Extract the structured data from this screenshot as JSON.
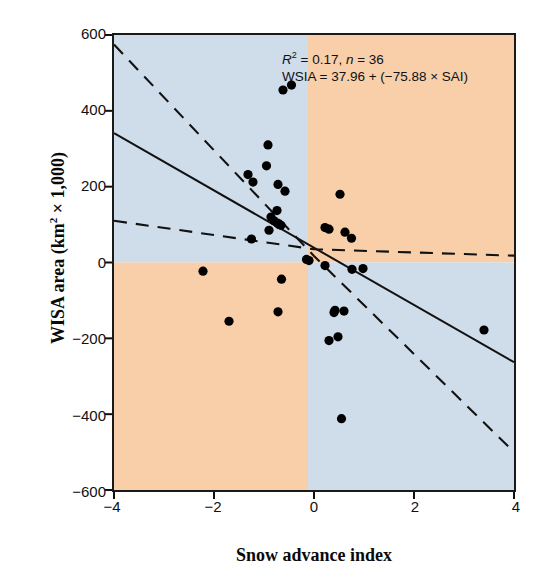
{
  "chart_data": {
    "type": "scatter",
    "title": "",
    "xlabel": "Snow advance index",
    "ylabel": "WISA area (km² × 1,000)",
    "xlim": [
      -4,
      4
    ],
    "ylim": [
      -600,
      600
    ],
    "xticks": [
      -4,
      -2,
      0,
      2,
      4
    ],
    "xtick_labels": [
      "−4",
      "−2",
      "0",
      "2",
      "4"
    ],
    "yticks": [
      -600,
      -400,
      -200,
      0,
      200,
      400,
      600
    ],
    "ytick_labels": [
      "−600",
      "−400",
      "−200",
      "0",
      "200",
      "400",
      "600"
    ],
    "grid": false,
    "legend": "none",
    "annotations": [
      {
        "line1_r2_label": "R",
        "line1_r2_sup": "2",
        "line1_rest": " = 0.17, ",
        "line1_n_label": "n",
        "line1_n_rest": " = 36"
      },
      {
        "line2": "WSIA = 37.96 + (−75.88 × SAI)"
      }
    ],
    "annotation_text": "R² = 0.17, n = 36 ; WSIA = 37.96 + (−75.88 × SAI)",
    "r_squared": 0.17,
    "n": 36,
    "regression_equation": "WSIA = 37.96 + (−75.88 × SAI)",
    "regression_intercept": 37.96,
    "regression_slope": -75.88,
    "quadrant_shading": {
      "x_divider": -0.12,
      "y_divider": 0,
      "top_left_color": "#cfdcea",
      "top_right_color": "#f8cfa9",
      "bottom_left_color": "#f8cfa9",
      "bottom_right_color": "#cfdcea"
    },
    "series": [
      {
        "name": "Observations",
        "marker": "filled-circle",
        "color": "#000000",
        "points": [
          [
            -0.62,
            455
          ],
          [
            -0.45,
            468
          ],
          [
            -0.92,
            310
          ],
          [
            -0.95,
            255
          ],
          [
            -1.32,
            232
          ],
          [
            -1.22,
            212
          ],
          [
            -0.72,
            206
          ],
          [
            -0.58,
            188
          ],
          [
            -0.74,
            137
          ],
          [
            -0.86,
            120
          ],
          [
            -0.8,
            110
          ],
          [
            -0.73,
            104
          ],
          [
            -0.7,
            100
          ],
          [
            -0.66,
            98
          ],
          [
            -0.9,
            85
          ],
          [
            -1.25,
            62
          ],
          [
            -0.15,
            8
          ],
          [
            -0.1,
            5
          ],
          [
            0.52,
            180
          ],
          [
            0.22,
            92
          ],
          [
            0.3,
            88
          ],
          [
            0.62,
            80
          ],
          [
            0.75,
            64
          ],
          [
            0.22,
            -8
          ],
          [
            0.76,
            -18
          ],
          [
            0.98,
            -16
          ],
          [
            -2.22,
            -23
          ],
          [
            -0.65,
            -44
          ],
          [
            -0.72,
            -130
          ],
          [
            -1.7,
            -155
          ],
          [
            0.4,
            -132
          ],
          [
            0.42,
            -126
          ],
          [
            0.6,
            -128
          ],
          [
            0.48,
            -196
          ],
          [
            0.3,
            -206
          ],
          [
            3.4,
            -178
          ],
          [
            0.55,
            -412
          ]
        ]
      }
    ],
    "lines": [
      {
        "name": "regression-line",
        "style": "solid",
        "x": [
          -4,
          4
        ],
        "y": [
          341,
          -263
        ]
      },
      {
        "name": "upper-confidence-band",
        "style": "dashed",
        "x": [
          -4,
          0,
          4
        ],
        "y": [
          575,
          17,
          -500
        ]
      },
      {
        "name": "lower-confidence-band",
        "style": "dashed",
        "x": [
          -4,
          0,
          4
        ],
        "y": [
          110,
          35,
          18
        ]
      }
    ]
  }
}
